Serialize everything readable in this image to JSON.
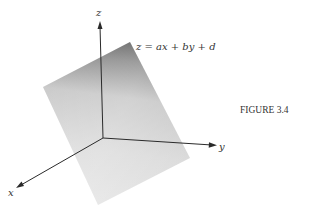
{
  "figure": {
    "caption": "FIGURE 3.4",
    "equation": "z = ax + by + d",
    "axes": {
      "x_label": "x",
      "y_label": "y",
      "z_label": "z"
    },
    "colors": {
      "axis": "#2a2a2a",
      "plane_dark": "#6e6e6e",
      "plane_light": "#e6e6e6",
      "text": "#333333"
    }
  }
}
